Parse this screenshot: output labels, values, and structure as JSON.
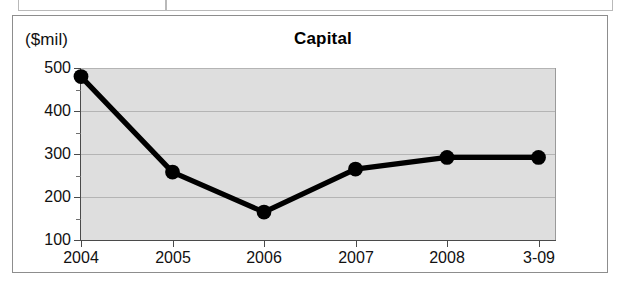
{
  "top_fragment": {
    "present": true,
    "cells": [
      "",
      ""
    ]
  },
  "chart": {
    "title": "Capital",
    "unit_label": "($mil)"
  },
  "chart_data": {
    "type": "line",
    "title": "Capital",
    "subtitle": "",
    "xlabel": "",
    "ylabel": "($mil)",
    "unit": "$mil",
    "categories": [
      "2004",
      "2005",
      "2006",
      "2007",
      "2008",
      "3-09"
    ],
    "values": [
      480,
      258,
      165,
      265,
      292,
      292
    ],
    "series": [
      {
        "name": "Capital",
        "values": [
          480,
          258,
          165,
          265,
          292,
          292
        ]
      }
    ],
    "ylim": [
      100,
      500
    ],
    "yticks": [
      100,
      200,
      300,
      400,
      500
    ],
    "ytick_labels": [
      "100",
      "200",
      "300",
      "400",
      "500"
    ],
    "yminor_ticks": [
      150,
      250,
      350,
      450
    ],
    "xticks": [
      "2004",
      "2005",
      "2006",
      "2007",
      "2008",
      "3-09"
    ],
    "grid": true,
    "grid_axis": "y",
    "legend": false,
    "legend_position": "none",
    "marker": "circle",
    "line_color": "#000000",
    "marker_color": "#000000",
    "plot_background": "#dedede",
    "figure_background": "#ffffff",
    "annotations": []
  }
}
